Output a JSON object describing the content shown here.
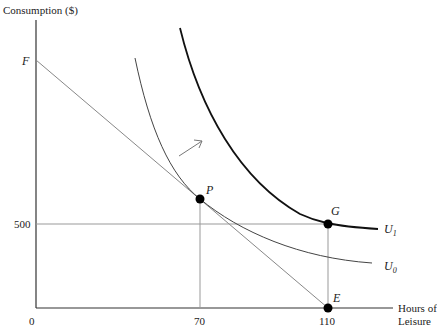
{
  "diagram": {
    "type": "labor-leisure indifference curve diagram",
    "y_axis_label": "Consumption ($)",
    "x_axis_label_line1": "Hours of",
    "x_axis_label_line2": "Leisure",
    "ticks": {
      "origin": "0",
      "x70": "70",
      "x110": "110",
      "y500": "500"
    },
    "points": {
      "F": "F",
      "P": "P",
      "G": "G",
      "E": "E"
    },
    "curves": {
      "U0": "U",
      "U0_sub": "0",
      "U1": "U",
      "U1_sub": "1"
    },
    "colors": {
      "axis": "#333333",
      "thin_line": "#888888",
      "u0": "#444444",
      "u1": "#111111",
      "point": "#000000"
    }
  }
}
